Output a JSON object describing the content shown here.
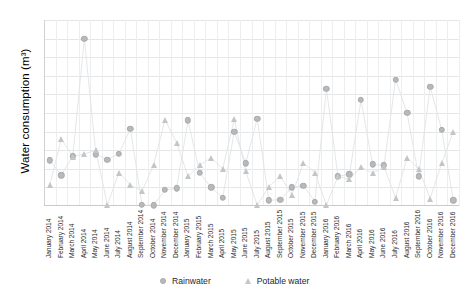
{
  "chart_data": {
    "type": "line",
    "title": "",
    "xlabel": "",
    "ylabel": "Water consumption (m³)",
    "ylim": [
      0,
      50
    ],
    "yticks": [
      0,
      5,
      10,
      15,
      20,
      25,
      30,
      35,
      40,
      45,
      50
    ],
    "grid": true,
    "legend_position": "bottom",
    "categories": [
      "January 2014",
      "February 2014",
      "March 2014",
      "April 2014",
      "May 2014",
      "June 2014",
      "July 2014",
      "August 2014",
      "September 2014",
      "October 2014",
      "November 2014",
      "December 2014",
      "January 2015",
      "February 2015",
      "March 2015",
      "April 2015",
      "May 2015",
      "June 2015",
      "July 2015",
      "August 2015",
      "September 2015",
      "October 2015",
      "November 2015",
      "December 2015",
      "January 2016",
      "February 2016",
      "March 2016",
      "April 2016",
      "May 2016",
      "June 2016",
      "July 2016",
      "August 2016",
      "September 2016",
      "October 2016",
      "November 2016",
      "December 2016"
    ],
    "series": [
      {
        "name": "Rainwater",
        "marker": "circle",
        "color": "#b7b9bb",
        "values": [
          12.3,
          8.3,
          13.4,
          45.0,
          13.9,
          12.5,
          14.0,
          20.8,
          0.3,
          0.2,
          4.3,
          4.8,
          23.0,
          9.0,
          5.0,
          2.2,
          20.0,
          11.5,
          23.5,
          1.5,
          1.7,
          5.0,
          5.5,
          1.2,
          31.5,
          8.0,
          8.5,
          28.5,
          11.2,
          10.9,
          34.0,
          25.0,
          8.0,
          32.0,
          20.5,
          1.5
        ]
      },
      {
        "name": "Potable water",
        "marker": "triangle",
        "color": "#c3c5c7",
        "values": [
          5.6,
          18.0,
          13.3,
          14.0,
          15.0,
          0.2,
          9.0,
          5.7,
          4.0,
          11.0,
          23.2,
          17.0,
          8.0,
          11.0,
          13.0,
          10.0,
          23.3,
          9.3,
          0.2,
          5.2,
          8.0,
          3.0,
          11.5,
          9.0,
          0.2,
          8.0,
          7.2,
          10.5,
          8.8,
          10.5,
          2.2,
          13.0,
          10.0,
          2.0,
          11.5,
          20.0
        ]
      }
    ]
  },
  "legend": {
    "items": [
      {
        "label": "Rainwater",
        "marker": "circle"
      },
      {
        "label": "Potable water",
        "marker": "triangle"
      }
    ]
  }
}
